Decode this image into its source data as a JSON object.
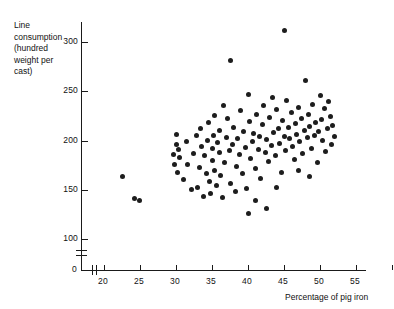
{
  "chart_data": {
    "type": "scatter",
    "title": "",
    "xlabel": "Percentage of pig iron",
    "ylabel": "Line consumption (hundred weight per cast)",
    "ylabel_lines": [
      "Line",
      "consumption",
      "(hundred",
      "weight per",
      "cast)"
    ],
    "xlim": [
      17.5,
      57.5
    ],
    "ylim": [
      95,
      320
    ],
    "axis_break_x": true,
    "axis_break_y": true,
    "origin_label": "0",
    "grid": false,
    "legend": null,
    "marker_color": "#1d1d1d",
    "xticks": [
      20,
      25,
      30,
      35,
      40,
      45,
      50,
      55
    ],
    "xtick_labels": [
      "20",
      "25",
      "30",
      "35",
      "40",
      "45",
      "50",
      "55"
    ],
    "yticks": [
      100,
      150,
      200,
      250,
      300
    ],
    "ytick_labels": [
      "100",
      "150",
      "200",
      "250",
      "300"
    ],
    "n_points": 124,
    "points": [
      [
        22.6,
        163
      ],
      [
        24.2,
        141
      ],
      [
        24.9,
        139
      ],
      [
        29.6,
        186
      ],
      [
        29.8,
        176
      ],
      [
        30.0,
        196
      ],
      [
        30.1,
        206
      ],
      [
        30.2,
        168
      ],
      [
        30.4,
        191
      ],
      [
        30.5,
        183
      ],
      [
        31.0,
        160
      ],
      [
        31.4,
        199
      ],
      [
        31.6,
        176
      ],
      [
        32.2,
        150
      ],
      [
        32.4,
        187
      ],
      [
        32.8,
        205
      ],
      [
        33.0,
        152
      ],
      [
        33.2,
        173
      ],
      [
        33.4,
        212
      ],
      [
        33.6,
        194
      ],
      [
        33.8,
        143
      ],
      [
        34.0,
        185
      ],
      [
        34.2,
        167
      ],
      [
        34.4,
        200
      ],
      [
        34.5,
        218
      ],
      [
        34.6,
        158
      ],
      [
        34.8,
        146
      ],
      [
        35.0,
        192
      ],
      [
        35.1,
        180
      ],
      [
        35.2,
        205
      ],
      [
        35.3,
        225
      ],
      [
        35.4,
        170
      ],
      [
        35.6,
        154
      ],
      [
        35.8,
        198
      ],
      [
        36.0,
        210
      ],
      [
        36.1,
        188
      ],
      [
        36.2,
        164
      ],
      [
        36.4,
        142
      ],
      [
        36.6,
        236
      ],
      [
        36.8,
        178
      ],
      [
        37.0,
        203
      ],
      [
        37.2,
        222
      ],
      [
        37.4,
        190
      ],
      [
        37.5,
        281
      ],
      [
        37.6,
        156
      ],
      [
        37.8,
        196
      ],
      [
        38.0,
        213
      ],
      [
        38.2,
        148
      ],
      [
        38.4,
        174
      ],
      [
        38.6,
        202
      ],
      [
        38.8,
        186
      ],
      [
        39.0,
        230
      ],
      [
        39.2,
        166
      ],
      [
        39.4,
        209
      ],
      [
        39.6,
        193
      ],
      [
        39.8,
        151
      ],
      [
        40.0,
        247
      ],
      [
        40.2,
        219
      ],
      [
        40.4,
        182
      ],
      [
        40.6,
        199
      ],
      [
        40.8,
        207
      ],
      [
        41.0,
        172
      ],
      [
        41.2,
        226
      ],
      [
        41.4,
        191
      ],
      [
        41.6,
        204
      ],
      [
        41.8,
        161
      ],
      [
        42.0,
        216
      ],
      [
        42.2,
        236
      ],
      [
        42.4,
        188
      ],
      [
        42.6,
        201
      ],
      [
        42.8,
        179
      ],
      [
        43.0,
        223
      ],
      [
        43.2,
        195
      ],
      [
        43.4,
        244
      ],
      [
        43.6,
        208
      ],
      [
        43.8,
        185
      ],
      [
        44.0,
        231
      ],
      [
        44.2,
        212
      ],
      [
        44.4,
        197
      ],
      [
        44.6,
        168
      ],
      [
        44.8,
        220
      ],
      [
        45.0,
        204
      ],
      [
        45.1,
        312
      ],
      [
        45.2,
        190
      ],
      [
        45.4,
        241
      ],
      [
        45.6,
        213
      ],
      [
        45.8,
        202
      ],
      [
        46.0,
        228
      ],
      [
        46.2,
        194
      ],
      [
        46.4,
        181
      ],
      [
        46.6,
        217
      ],
      [
        46.8,
        206
      ],
      [
        47.0,
        233
      ],
      [
        47.2,
        199
      ],
      [
        47.4,
        222
      ],
      [
        47.6,
        187
      ],
      [
        47.8,
        210
      ],
      [
        48.0,
        261
      ],
      [
        48.2,
        203
      ],
      [
        48.4,
        226
      ],
      [
        48.6,
        214
      ],
      [
        48.8,
        192
      ],
      [
        49.0,
        237
      ],
      [
        49.2,
        205
      ],
      [
        49.4,
        218
      ],
      [
        49.6,
        178
      ],
      [
        49.8,
        209
      ],
      [
        50.0,
        246
      ],
      [
        50.2,
        221
      ],
      [
        50.4,
        200
      ],
      [
        50.6,
        232
      ],
      [
        50.8,
        189
      ],
      [
        51.0,
        212
      ],
      [
        51.2,
        240
      ],
      [
        51.4,
        224
      ],
      [
        51.6,
        196
      ],
      [
        51.8,
        215
      ],
      [
        52.0,
        204
      ],
      [
        48.5,
        163
      ],
      [
        47.0,
        170
      ],
      [
        44.0,
        152
      ],
      [
        42.5,
        131
      ],
      [
        41.0,
        139
      ],
      [
        40.0,
        126
      ]
    ]
  }
}
